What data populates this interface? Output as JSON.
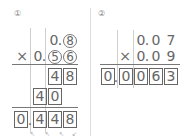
{
  "problem1": {
    "label": "①",
    "multiplicand": [
      "0",
      ".",
      "8"
    ],
    "multiplier_sign": "×",
    "multiplier": [
      "0",
      ".",
      "5",
      "6"
    ],
    "circled_digits": [
      "8",
      "5",
      "6"
    ],
    "partial1": [
      "4",
      "8"
    ],
    "partial2": [
      "4",
      "0"
    ],
    "result": [
      "0",
      ".",
      "4",
      "4",
      "8"
    ],
    "hint_marks": [
      "↖",
      "↖",
      "↖",
      "↙"
    ]
  },
  "problem2": {
    "label": "②",
    "multiplicand": [
      "0",
      ".",
      "0",
      "7"
    ],
    "multiplier_sign": "×",
    "multiplier": [
      "0",
      ".",
      "0",
      "9"
    ],
    "result": [
      "0",
      ".",
      "0",
      "0",
      "6",
      "3"
    ]
  }
}
